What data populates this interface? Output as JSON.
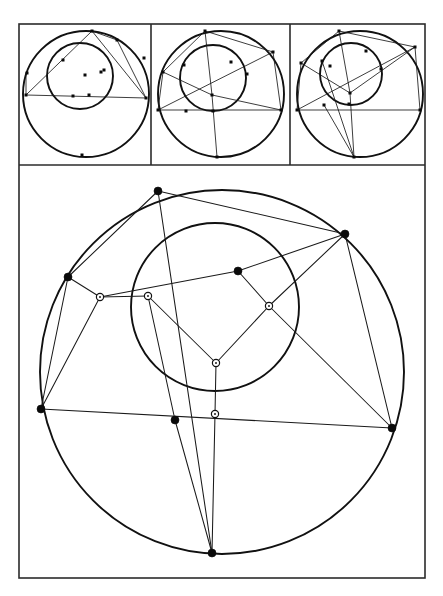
{
  "figure": {
    "title": "",
    "caption": "",
    "background_color": "#ffffff",
    "ink_color": "#111111",
    "frame_color": "#2b2b2b"
  },
  "layout": {
    "width": 443,
    "height": 596,
    "outer_frame": {
      "x": 19,
      "y": 24,
      "w": 406,
      "h": 554
    },
    "panel_strip": {
      "x": 19,
      "y": 24,
      "w": 406,
      "h": 141,
      "panel_count": 3
    },
    "panel_dividers_x": [
      151,
      290
    ],
    "strip_bottom_y": 165,
    "main_panel": {
      "x": 19,
      "y": 165,
      "w": 406,
      "h": 413
    }
  },
  "chart_data": {
    "type": "scatter",
    "xlabel": "",
    "ylabel": "",
    "xlim": [
      0,
      443
    ],
    "ylim": [
      596,
      0
    ],
    "grid": false,
    "legend_position": "none",
    "marker_styles": {
      "filled": "filled black square/disc vertex on outer circle",
      "hollow": "open circle with dark center, tangency/contact point on inner circle"
    },
    "panels": [
      {
        "id": "panel-1",
        "label": "",
        "center": [
          86,
          94
        ],
        "outer_radius": 63,
        "inner": {
          "center": [
            80,
            76
          ],
          "radius": 33
        },
        "outer_vertices": [
          [
            92,
            31
          ],
          [
            26,
            95
          ],
          [
            146,
            98
          ],
          [
            117,
            40
          ],
          [
            144,
            58
          ],
          [
            27,
            73
          ],
          [
            82,
            155
          ]
        ],
        "inner_points": [
          [
            63,
            60
          ],
          [
            104,
            70
          ],
          [
            89,
            95
          ],
          [
            73,
            96
          ],
          [
            101,
            72
          ],
          [
            85,
            75
          ]
        ],
        "chords": [
          [
            [
              92,
              31
            ],
            [
              26,
              95
            ]
          ],
          [
            [
              26,
              95
            ],
            [
              146,
              98
            ]
          ],
          [
            [
              146,
              98
            ],
            [
              92,
              31
            ]
          ],
          [
            [
              92,
              31
            ],
            [
              117,
              40
            ]
          ],
          [
            [
              117,
              40
            ],
            [
              146,
              98
            ]
          ],
          [
            [
              26,
              73
            ],
            [
              26,
              95
            ]
          ]
        ]
      },
      {
        "id": "panel-2",
        "label": "",
        "center": [
          221,
          94
        ],
        "outer_radius": 63,
        "inner": {
          "center": [
            213,
            78
          ],
          "radius": 33
        },
        "outer_vertices": [
          [
            205,
            31
          ],
          [
            163,
            72
          ],
          [
            158,
            110
          ],
          [
            273,
            52
          ],
          [
            281,
            110
          ],
          [
            217,
            157
          ]
        ],
        "inner_points": [
          [
            184,
            65
          ],
          [
            231,
            62
          ],
          [
            213,
            111
          ],
          [
            186,
            111
          ],
          [
            247,
            74
          ],
          [
            212,
            95
          ]
        ],
        "chords": [
          [
            [
              205,
              31
            ],
            [
              163,
              72
            ]
          ],
          [
            [
              163,
              72
            ],
            [
              158,
              110
            ]
          ],
          [
            [
              158,
              110
            ],
            [
              281,
              110
            ]
          ],
          [
            [
              281,
              110
            ],
            [
              273,
              52
            ]
          ],
          [
            [
              273,
              52
            ],
            [
              205,
              31
            ]
          ],
          [
            [
              205,
              31
            ],
            [
              212,
              95
            ]
          ],
          [
            [
              163,
              72
            ],
            [
              212,
              95
            ]
          ],
          [
            [
              212,
              95
            ],
            [
              281,
              110
            ]
          ],
          [
            [
              217,
              157
            ],
            [
              212,
              95
            ]
          ],
          [
            [
              158,
              110
            ],
            [
              273,
              52
            ]
          ]
        ]
      },
      {
        "id": "panel-3",
        "label": "",
        "center": [
          360,
          94
        ],
        "outer_radius": 63,
        "inner": {
          "center": [
            351,
            74
          ],
          "radius": 31
        },
        "outer_vertices": [
          [
            339,
            31
          ],
          [
            301,
            63
          ],
          [
            297,
            110
          ],
          [
            415,
            47
          ],
          [
            420,
            110
          ],
          [
            354,
            157
          ]
        ],
        "inner_points": [
          [
            322,
            61
          ],
          [
            366,
            51
          ],
          [
            349,
            104
          ],
          [
            324,
            105
          ],
          [
            381,
            69
          ],
          [
            350,
            93
          ],
          [
            330,
            66
          ]
        ],
        "chords": [
          [
            [
              339,
              31
            ],
            [
              301,
              63
            ]
          ],
          [
            [
              301,
              63
            ],
            [
              297,
              110
            ]
          ],
          [
            [
              297,
              110
            ],
            [
              420,
              110
            ]
          ],
          [
            [
              420,
              110
            ],
            [
              415,
              47
            ]
          ],
          [
            [
              415,
              47
            ],
            [
              339,
              31
            ]
          ],
          [
            [
              339,
              31
            ],
            [
              350,
              93
            ]
          ],
          [
            [
              301,
              63
            ],
            [
              350,
              93
            ]
          ],
          [
            [
              350,
              93
            ],
            [
              415,
              47
            ]
          ],
          [
            [
              354,
              157
            ],
            [
              350,
              93
            ]
          ],
          [
            [
              297,
              110
            ],
            [
              415,
              47
            ]
          ],
          [
            [
              354,
              157
            ],
            [
              322,
              61
            ]
          ],
          [
            [
              324,
              105
            ],
            [
              354,
              157
            ]
          ]
        ]
      }
    ],
    "main": {
      "id": "main-figure",
      "outer_circle": {
        "center": [
          222,
          372
        ],
        "radius": 182
      },
      "inner_circle": {
        "center": [
          215,
          307
        ],
        "radius": 84
      },
      "outer_vertices": [
        [
          158,
          191
        ],
        [
          345,
          234
        ],
        [
          68,
          277
        ],
        [
          238,
          271
        ],
        [
          41,
          409
        ],
        [
          392,
          428
        ],
        [
          175,
          420
        ],
        [
          212,
          553
        ]
      ],
      "inner_tangency_points": [
        [
          100,
          297
        ],
        [
          148,
          296
        ],
        [
          269,
          306
        ],
        [
          216,
          363
        ],
        [
          215,
          414
        ]
      ],
      "chords": [
        [
          [
            158,
            191
          ],
          [
            68,
            277
          ]
        ],
        [
          [
            158,
            191
          ],
          [
            345,
            234
          ]
        ],
        [
          [
            345,
            234
          ],
          [
            392,
            428
          ]
        ],
        [
          [
            392,
            428
          ],
          [
            41,
            409
          ]
        ],
        [
          [
            41,
            409
          ],
          [
            68,
            277
          ]
        ],
        [
          [
            158,
            191
          ],
          [
            212,
            553
          ]
        ],
        [
          [
            345,
            234
          ],
          [
            238,
            271
          ]
        ],
        [
          [
            238,
            271
          ],
          [
            100,
            297
          ]
        ],
        [
          [
            100,
            297
          ],
          [
            148,
            296
          ]
        ],
        [
          [
            148,
            296
          ],
          [
            216,
            363
          ]
        ],
        [
          [
            216,
            363
          ],
          [
            269,
            306
          ]
        ],
        [
          [
            269,
            306
          ],
          [
            238,
            271
          ]
        ],
        [
          [
            100,
            297
          ],
          [
            41,
            409
          ]
        ],
        [
          [
            148,
            296
          ],
          [
            175,
            420
          ]
        ],
        [
          [
            216,
            363
          ],
          [
            215,
            414
          ]
        ],
        [
          [
            215,
            414
          ],
          [
            212,
            553
          ]
        ],
        [
          [
            175,
            420
          ],
          [
            212,
            553
          ]
        ],
        [
          [
            68,
            277
          ],
          [
            100,
            297
          ]
        ],
        [
          [
            269,
            306
          ],
          [
            345,
            234
          ]
        ],
        [
          [
            269,
            306
          ],
          [
            392,
            428
          ]
        ]
      ]
    }
  }
}
